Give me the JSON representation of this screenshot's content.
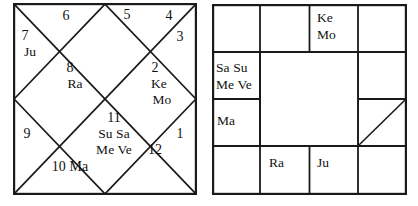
{
  "page": {
    "background_color": "#ffffff",
    "ink_color": "#111111",
    "width": 418,
    "height": 206
  },
  "charts": [
    {
      "name": "north-indian-chart",
      "style": "North Indian (diamond / kundli)",
      "houses": [
        {
          "number": "1",
          "planets": ""
        },
        {
          "number": "2",
          "planets": "Ke\nMo"
        },
        {
          "number": "3",
          "planets": ""
        },
        {
          "number": "4",
          "planets": ""
        },
        {
          "number": "5",
          "planets": ""
        },
        {
          "number": "6",
          "planets": ""
        },
        {
          "number": "7",
          "planets": "Ju"
        },
        {
          "number": "8",
          "planets": "Ra"
        },
        {
          "number": "9",
          "planets": ""
        },
        {
          "number": "10",
          "planets": "Ma"
        },
        {
          "number": "11",
          "planets": "Su Sa\nMe Ve"
        },
        {
          "number": "12",
          "planets": ""
        }
      ],
      "labels": {
        "h1_num": "1",
        "h2_num": "2",
        "h2_p1": "Ke",
        "h2_p2": "Mo",
        "h3_num": "3",
        "h4_num": "4",
        "h5_num": "5",
        "h6_num": "6",
        "h7_num": "7",
        "h7_p1": "Ju",
        "h8_num": "8",
        "h8_p1": "Ra",
        "h9_num": "9",
        "h10_line": "10 Ma",
        "h11_num": "11",
        "h11_p1": "Su Sa",
        "h11_p2": "Me Ve",
        "h12_num": "12"
      }
    },
    {
      "name": "south-indian-chart",
      "style": "South Indian (4x4 grid, hollow centre)",
      "cells": {
        "r1c1": "",
        "r1c2": "",
        "r1c3": "Ke\nMo",
        "r1c4": "",
        "r2c1": "Sa Su\nMe Ve",
        "r2c4": "",
        "r3c1": "Ma",
        "r3c4": "",
        "r4c1": "",
        "r4c2": "Ra",
        "r4c3": "Ju",
        "r4c4": ""
      },
      "labels": {
        "ke": "Ke",
        "mo": "Mo",
        "sa_su": "Sa Su",
        "me_ve": "Me Ve",
        "ma": "Ma",
        "ra": "Ra",
        "ju": "Ju"
      },
      "marker": {
        "name": "ascendant-diagonal",
        "description": "diagonal slash in right column third row"
      }
    }
  ]
}
